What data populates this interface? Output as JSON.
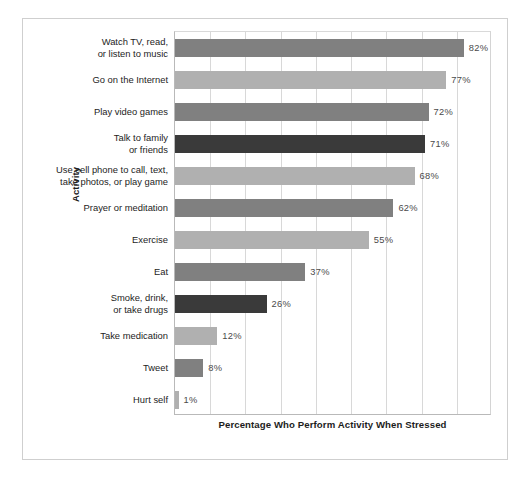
{
  "chart_data": {
    "type": "bar",
    "orientation": "horizontal",
    "title": "",
    "xlabel": "Percentage Who Perform Activity When Stressed",
    "ylabel": "Activity",
    "xlim": [
      0,
      90
    ],
    "grid": true,
    "legend": false,
    "value_suffix": "%",
    "categories": [
      "Watch TV, read,\nor listen to music",
      "Go on the Internet",
      "Play video games",
      "Talk to family\nor friends",
      "Use cell phone to call, text,\ntake photos, or play game",
      "Prayer or meditation",
      "Exercise",
      "Eat",
      "Smoke, drink,\nor take drugs",
      "Take medication",
      "Tweet",
      "Hurt self"
    ],
    "values": [
      82,
      77,
      72,
      71,
      68,
      62,
      55,
      37,
      26,
      12,
      8,
      1
    ],
    "value_labels": [
      "82%",
      "77%",
      "72%",
      "71%",
      "68%",
      "62%",
      "55%",
      "37%",
      "26%",
      "12%",
      "8%",
      "1%"
    ],
    "bar_colors": [
      "#808080",
      "#b0b0b0",
      "#808080",
      "#3a3a3a",
      "#b0b0b0",
      "#808080",
      "#b0b0b0",
      "#808080",
      "#3a3a3a",
      "#b0b0b0",
      "#808080",
      "#b0b0b0"
    ]
  },
  "colors": {
    "figure_border": "#cfcfcf",
    "axis": "#b9b9b9",
    "gridline": "#d8d8d8",
    "text": "#1d1d1d",
    "value_text": "#4a4a4a",
    "background": "#ffffff"
  }
}
